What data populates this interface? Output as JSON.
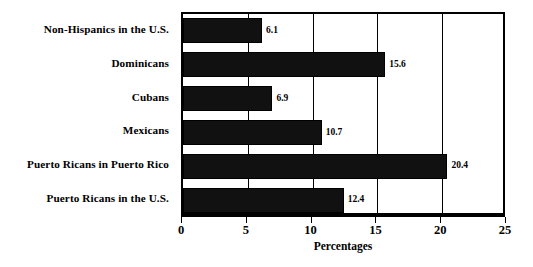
{
  "chart_data": {
    "type": "bar",
    "orientation": "horizontal",
    "title": "",
    "xlabel": "Percentages",
    "ylabel": "",
    "xlim": [
      0,
      25
    ],
    "xticks": [
      0,
      5,
      10,
      15,
      20,
      25
    ],
    "xtick_labels": [
      "0",
      "5",
      "10",
      "15",
      "20",
      "25"
    ],
    "grid": true,
    "grid_axis": "x",
    "legend": false,
    "categories": [
      "Non-Hispanics in the U.S.",
      "Dominicans",
      "Cubans",
      "Mexicans",
      "Puerto Ricans in Puerto Rico",
      "Puerto Ricans in the U.S."
    ],
    "values": [
      6.1,
      15.6,
      6.9,
      10.7,
      20.4,
      12.4
    ],
    "value_labels": [
      "6.1",
      "15.6",
      "6.9",
      "10.7",
      "20.4",
      "12.4"
    ],
    "bar_color": "#111111",
    "bar_pattern": "dotted-fill",
    "background_color": "#ffffff",
    "axis_color": "#000000"
  }
}
